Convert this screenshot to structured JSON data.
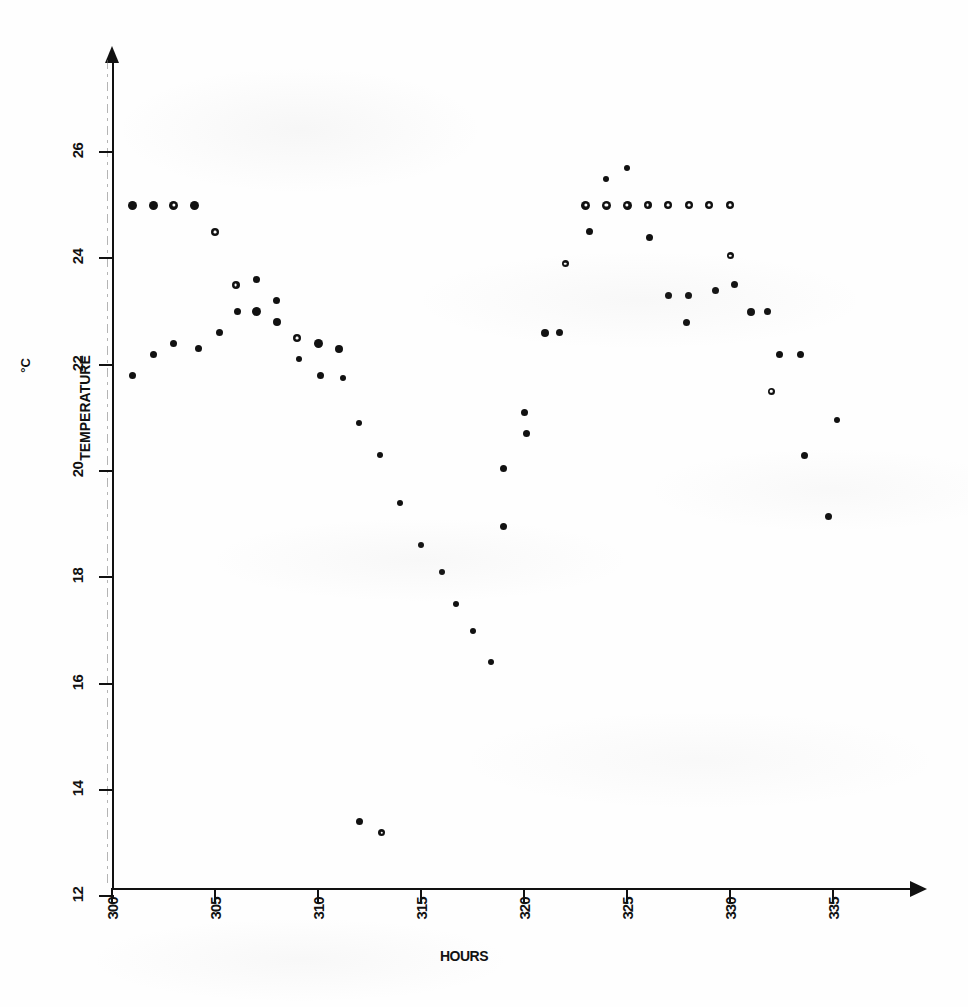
{
  "chart_data": {
    "type": "scatter",
    "title": "",
    "xlabel": "HOURS",
    "ylabel": "TEMPERATURE",
    "yunit": "°C",
    "xlim": [
      300,
      337
    ],
    "ylim": [
      12,
      26.8
    ],
    "xticks": [
      300,
      305,
      310,
      315,
      320,
      325,
      330,
      335
    ],
    "yticks": [
      12,
      14,
      16,
      18,
      20,
      22,
      24,
      26
    ],
    "grid": false,
    "legend": "none",
    "marker_kinds": {
      "filled": "filled-circle",
      "open": "open-circle"
    },
    "series": [
      {
        "name": "temperature-readings",
        "points": [
          {
            "x": 301.0,
            "y": 25.0,
            "m": "filled",
            "s": 9
          },
          {
            "x": 302.0,
            "y": 25.0,
            "m": "filled",
            "s": 9
          },
          {
            "x": 303.0,
            "y": 25.0,
            "m": "open",
            "s": 9
          },
          {
            "x": 304.0,
            "y": 25.0,
            "m": "filled",
            "s": 9
          },
          {
            "x": 305.0,
            "y": 24.5,
            "m": "open",
            "s": 8
          },
          {
            "x": 301.0,
            "y": 21.8,
            "m": "filled",
            "s": 7
          },
          {
            "x": 302.0,
            "y": 22.2,
            "m": "filled",
            "s": 7
          },
          {
            "x": 303.0,
            "y": 22.4,
            "m": "filled",
            "s": 7
          },
          {
            "x": 304.2,
            "y": 22.3,
            "m": "filled",
            "s": 7
          },
          {
            "x": 305.2,
            "y": 22.6,
            "m": "filled",
            "s": 7
          },
          {
            "x": 306.0,
            "y": 23.5,
            "m": "open",
            "s": 8
          },
          {
            "x": 306.1,
            "y": 23.0,
            "m": "filled",
            "s": 7
          },
          {
            "x": 307.0,
            "y": 23.6,
            "m": "filled",
            "s": 7
          },
          {
            "x": 307.0,
            "y": 23.0,
            "m": "filled",
            "s": 9
          },
          {
            "x": 308.0,
            "y": 23.2,
            "m": "filled",
            "s": 7
          },
          {
            "x": 308.0,
            "y": 22.8,
            "m": "filled",
            "s": 8
          },
          {
            "x": 309.0,
            "y": 22.5,
            "m": "open",
            "s": 8
          },
          {
            "x": 309.1,
            "y": 22.1,
            "m": "filled",
            "s": 6
          },
          {
            "x": 310.0,
            "y": 22.4,
            "m": "filled",
            "s": 9
          },
          {
            "x": 310.1,
            "y": 21.8,
            "m": "filled",
            "s": 7
          },
          {
            "x": 311.0,
            "y": 22.3,
            "m": "filled",
            "s": 8
          },
          {
            "x": 311.2,
            "y": 21.75,
            "m": "filled",
            "s": 6
          },
          {
            "x": 312.0,
            "y": 20.9,
            "m": "filled",
            "s": 6
          },
          {
            "x": 313.0,
            "y": 20.3,
            "m": "filled",
            "s": 6
          },
          {
            "x": 314.0,
            "y": 19.4,
            "m": "filled",
            "s": 6
          },
          {
            "x": 315.0,
            "y": 18.6,
            "m": "filled",
            "s": 6
          },
          {
            "x": 316.0,
            "y": 18.1,
            "m": "filled",
            "s": 6
          },
          {
            "x": 316.7,
            "y": 17.5,
            "m": "filled",
            "s": 6
          },
          {
            "x": 317.5,
            "y": 17.0,
            "m": "filled",
            "s": 6
          },
          {
            "x": 318.4,
            "y": 16.4,
            "m": "filled",
            "s": 6
          },
          {
            "x": 312.0,
            "y": 13.4,
            "m": "filled",
            "s": 7
          },
          {
            "x": 313.1,
            "y": 13.2,
            "m": "open",
            "s": 7
          },
          {
            "x": 319.0,
            "y": 20.05,
            "m": "filled",
            "s": 7
          },
          {
            "x": 319.0,
            "y": 18.95,
            "m": "filled",
            "s": 7
          },
          {
            "x": 320.0,
            "y": 21.1,
            "m": "filled",
            "s": 7
          },
          {
            "x": 320.1,
            "y": 20.7,
            "m": "filled",
            "s": 7
          },
          {
            "x": 321.0,
            "y": 22.6,
            "m": "filled",
            "s": 8
          },
          {
            "x": 321.7,
            "y": 22.6,
            "m": "filled",
            "s": 7
          },
          {
            "x": 322.0,
            "y": 23.9,
            "m": "open",
            "s": 7
          },
          {
            "x": 323.0,
            "y": 25.0,
            "m": "open",
            "s": 9
          },
          {
            "x": 324.0,
            "y": 25.0,
            "m": "open",
            "s": 9
          },
          {
            "x": 325.0,
            "y": 25.0,
            "m": "open",
            "s": 9
          },
          {
            "x": 326.0,
            "y": 25.0,
            "m": "open",
            "s": 8
          },
          {
            "x": 327.0,
            "y": 25.0,
            "m": "open",
            "s": 8
          },
          {
            "x": 328.0,
            "y": 25.0,
            "m": "open",
            "s": 8
          },
          {
            "x": 329.0,
            "y": 25.0,
            "m": "open",
            "s": 8
          },
          {
            "x": 330.0,
            "y": 25.0,
            "m": "open",
            "s": 8
          },
          {
            "x": 324.0,
            "y": 25.5,
            "m": "filled",
            "s": 6
          },
          {
            "x": 325.0,
            "y": 25.7,
            "m": "filled",
            "s": 6
          },
          {
            "x": 323.2,
            "y": 24.5,
            "m": "filled",
            "s": 7
          },
          {
            "x": 326.1,
            "y": 24.4,
            "m": "filled",
            "s": 7
          },
          {
            "x": 327.0,
            "y": 23.3,
            "m": "filled",
            "s": 7
          },
          {
            "x": 328.0,
            "y": 23.3,
            "m": "filled",
            "s": 7
          },
          {
            "x": 327.9,
            "y": 22.8,
            "m": "filled",
            "s": 7
          },
          {
            "x": 329.3,
            "y": 23.4,
            "m": "filled",
            "s": 7
          },
          {
            "x": 330.0,
            "y": 24.05,
            "m": "open",
            "s": 7
          },
          {
            "x": 330.2,
            "y": 23.5,
            "m": "filled",
            "s": 7
          },
          {
            "x": 331.0,
            "y": 23.0,
            "m": "filled",
            "s": 8
          },
          {
            "x": 331.8,
            "y": 23.0,
            "m": "filled",
            "s": 7
          },
          {
            "x": 332.4,
            "y": 22.2,
            "m": "filled",
            "s": 7
          },
          {
            "x": 333.4,
            "y": 22.2,
            "m": "filled",
            "s": 7
          },
          {
            "x": 332.0,
            "y": 21.5,
            "m": "open",
            "s": 7
          },
          {
            "x": 333.6,
            "y": 20.3,
            "m": "filled",
            "s": 7
          },
          {
            "x": 334.8,
            "y": 19.15,
            "m": "filled",
            "s": 7
          },
          {
            "x": 335.2,
            "y": 20.95,
            "m": "filled",
            "s": 6
          }
        ]
      }
    ]
  },
  "figure": {
    "y_axis_title": "TEMPERATURE",
    "y_axis_unit": "°C",
    "x_axis_title": "HOURS"
  }
}
